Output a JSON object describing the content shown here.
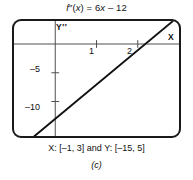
{
  "figure": {
    "equation_title": "f″(x) = 6x – 12",
    "window_caption": "X: [–1, 3] and Y: [–15, 5]",
    "figure_label": "(c)",
    "y_axis_label": "Y′′",
    "x_axis_label": "X"
  },
  "chart_data": {
    "type": "line",
    "title": "f″(x) = 6x – 12",
    "xlabel": "X",
    "ylabel": "Y′′",
    "xlim": [
      -1,
      3
    ],
    "ylim": [
      -15,
      5
    ],
    "grid": false,
    "legend": "none",
    "axes_shown": true,
    "xticks": [
      1,
      2
    ],
    "xtick_labels": [
      "1",
      "2"
    ],
    "yticks": [
      -5,
      -10
    ],
    "ytick_labels": [
      "–5",
      "–10"
    ],
    "series": [
      {
        "name": "f''(x) = 6x - 12",
        "expression": "6*x - 12",
        "slope": 6,
        "intercept": -12,
        "x_intercept": 2,
        "color": "#111111",
        "x": [
          -1,
          0,
          1,
          2,
          3
        ],
        "values": [
          -18,
          -12,
          -6,
          0,
          6
        ]
      }
    ],
    "annotations": [
      {
        "text": "X: [–1, 3] and Y: [–15, 5]",
        "position": "below-axes"
      },
      {
        "text": "(c)",
        "position": "figure-caption"
      }
    ]
  }
}
